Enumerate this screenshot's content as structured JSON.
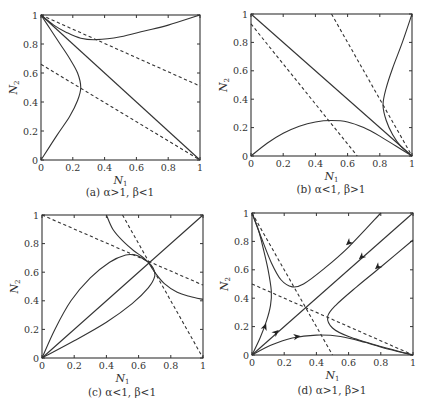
{
  "chart_data": [
    {
      "id": "a",
      "type": "line",
      "title": "",
      "caption": "(a) α>1, β<1",
      "xlabel": "N",
      "xlabel_sub": "1",
      "ylabel": "N",
      "ylabel_sub": "2",
      "xlim": [
        0,
        1
      ],
      "ylim": [
        0,
        1
      ],
      "xticks": [
        "0",
        "0.2",
        "0.4",
        "0.6",
        "0.8",
        "1"
      ],
      "yticks": [
        "0",
        "0.2",
        "0.4",
        "0.6",
        "0.8",
        "1"
      ],
      "grid": false,
      "frame": {
        "left": 41,
        "top": 15,
        "right": 200,
        "bottom": 160
      },
      "series": [
        {
          "name": "solid-diagonal",
          "style": "solid",
          "points": [
            [
              0,
              1
            ],
            [
              1,
              0
            ]
          ]
        },
        {
          "name": "nullcline-1",
          "style": "dashed",
          "points": [
            [
              0,
              1
            ],
            [
              1,
              0.51
            ]
          ]
        },
        {
          "name": "nullcline-2",
          "style": "dashed",
          "points": [
            [
              0,
              0.66
            ],
            [
              1,
              0
            ]
          ]
        },
        {
          "name": "trajectory-left",
          "style": "solid",
          "points": [
            [
              0,
              0
            ],
            [
              0.1,
              0.17
            ],
            [
              0.18,
              0.3
            ],
            [
              0.23,
              0.41
            ],
            [
              0.25,
              0.5
            ],
            [
              0.23,
              0.6
            ],
            [
              0.18,
              0.7
            ],
            [
              0.12,
              0.8
            ],
            [
              0.06,
              0.9
            ],
            [
              0,
              1
            ]
          ]
        },
        {
          "name": "trajectory-top",
          "style": "solid",
          "points": [
            [
              0,
              1
            ],
            [
              0.08,
              0.93
            ],
            [
              0.16,
              0.88
            ],
            [
              0.25,
              0.84
            ],
            [
              0.35,
              0.83
            ],
            [
              0.5,
              0.85
            ],
            [
              0.65,
              0.89
            ],
            [
              0.8,
              0.93
            ],
            [
              1,
              1
            ]
          ]
        }
      ]
    },
    {
      "id": "b",
      "type": "line",
      "title": "",
      "caption": "(b) α<1, β>1",
      "xlabel": "N",
      "xlabel_sub": "1",
      "ylabel": "N",
      "ylabel_sub": "2",
      "xlim": [
        0,
        1
      ],
      "ylim": [
        0,
        1
      ],
      "xticks": [
        "0",
        "0.2",
        "0.4",
        "0.6",
        "0.8",
        "1"
      ],
      "yticks": [
        "0",
        "0.2",
        "0.4",
        "0.6",
        "0.8",
        "1"
      ],
      "grid": false,
      "frame": {
        "left": 251,
        "top": 14,
        "right": 412,
        "bottom": 156
      },
      "series": [
        {
          "name": "solid-diagonal",
          "style": "solid",
          "points": [
            [
              0,
              1
            ],
            [
              1,
              0
            ]
          ]
        },
        {
          "name": "nullcline-1",
          "style": "dashed",
          "points": [
            [
              0,
              0.93
            ],
            [
              0.66,
              0
            ]
          ]
        },
        {
          "name": "nullcline-2",
          "style": "dashed",
          "points": [
            [
              0.5,
              1
            ],
            [
              1,
              0
            ]
          ]
        },
        {
          "name": "trajectory-bottom",
          "style": "solid",
          "points": [
            [
              0,
              0
            ],
            [
              0.1,
              0.09
            ],
            [
              0.2,
              0.16
            ],
            [
              0.3,
              0.21
            ],
            [
              0.4,
              0.24
            ],
            [
              0.5,
              0.25
            ],
            [
              0.6,
              0.24
            ],
            [
              0.7,
              0.2
            ],
            [
              0.8,
              0.14
            ],
            [
              0.9,
              0.07
            ],
            [
              1,
              0
            ]
          ]
        },
        {
          "name": "trajectory-right",
          "style": "solid",
          "points": [
            [
              1,
              1
            ],
            [
              0.94,
              0.8
            ],
            [
              0.88,
              0.62
            ],
            [
              0.84,
              0.48
            ],
            [
              0.82,
              0.36
            ],
            [
              0.84,
              0.25
            ],
            [
              0.88,
              0.15
            ],
            [
              0.93,
              0.07
            ],
            [
              1,
              0
            ]
          ]
        }
      ]
    },
    {
      "id": "c",
      "type": "line",
      "title": "",
      "caption": "(c) α<1, β<1",
      "xlabel": "N",
      "xlabel_sub": "1",
      "ylabel": "N",
      "ylabel_sub": "2",
      "xlim": [
        0,
        1
      ],
      "ylim": [
        0,
        1
      ],
      "xticks": [
        "0",
        "0.2",
        "0.4",
        "0.6",
        "0.8",
        "1"
      ],
      "yticks": [
        "0",
        "0.2",
        "0.4",
        "0.6",
        "0.8",
        "1"
      ],
      "grid": false,
      "frame": {
        "left": 42,
        "top": 215,
        "right": 203,
        "bottom": 358
      },
      "equilibrium": [
        0.66,
        0.67
      ],
      "series": [
        {
          "name": "solid-diagonal",
          "style": "solid",
          "points": [
            [
              0,
              0
            ],
            [
              1,
              1
            ]
          ]
        },
        {
          "name": "nullcline-1",
          "style": "dashed",
          "points": [
            [
              0,
              1
            ],
            [
              1,
              0.51
            ]
          ]
        },
        {
          "name": "nullcline-2",
          "style": "dashed",
          "points": [
            [
              0.5,
              1
            ],
            [
              1,
              0
            ]
          ]
        },
        {
          "name": "trajectory-upper-lobe",
          "style": "solid",
          "points": [
            [
              0,
              0
            ],
            [
              0.08,
              0.2
            ],
            [
              0.18,
              0.4
            ],
            [
              0.3,
              0.56
            ],
            [
              0.42,
              0.67
            ],
            [
              0.52,
              0.72
            ],
            [
              0.58,
              0.72
            ],
            [
              0.62,
              0.7
            ],
            [
              0.66,
              0.67
            ]
          ]
        },
        {
          "name": "trajectory-lower-lobe",
          "style": "solid",
          "points": [
            [
              0,
              0
            ],
            [
              0.2,
              0.12
            ],
            [
              0.4,
              0.25
            ],
            [
              0.56,
              0.38
            ],
            [
              0.66,
              0.49
            ],
            [
              0.7,
              0.57
            ],
            [
              0.69,
              0.63
            ],
            [
              0.66,
              0.67
            ]
          ]
        },
        {
          "name": "trajectory-top",
          "style": "solid",
          "points": [
            [
              0.4,
              1
            ],
            [
              0.44,
              0.9
            ],
            [
              0.5,
              0.82
            ],
            [
              0.57,
              0.75
            ],
            [
              0.62,
              0.71
            ],
            [
              0.66,
              0.67
            ]
          ]
        },
        {
          "name": "trajectory-right",
          "style": "solid",
          "points": [
            [
              0.66,
              0.67
            ],
            [
              0.7,
              0.6
            ],
            [
              0.76,
              0.52
            ],
            [
              0.84,
              0.46
            ],
            [
              0.92,
              0.43
            ],
            [
              1,
              0.41
            ]
          ]
        }
      ]
    },
    {
      "id": "d",
      "type": "line",
      "title": "",
      "caption": "(d) α>1, β>1",
      "xlabel": "N",
      "xlabel_sub": "1",
      "ylabel": "N",
      "ylabel_sub": "2",
      "xlim": [
        0,
        1
      ],
      "ylim": [
        0,
        1
      ],
      "xticks": [
        "0",
        "0.2",
        "0.4",
        "0.6",
        "0.8",
        "1"
      ],
      "yticks": [
        "0",
        "0.2",
        "0.4",
        "0.6",
        "0.8",
        "1"
      ],
      "grid": false,
      "frame": {
        "left": 252,
        "top": 213,
        "right": 413,
        "bottom": 355
      },
      "series": [
        {
          "name": "solid-diagonal",
          "style": "solid",
          "points": [
            [
              0,
              0
            ],
            [
              1,
              1
            ]
          ]
        },
        {
          "name": "nullcline-1",
          "style": "dashed",
          "points": [
            [
              0,
              1
            ],
            [
              0.5,
              0
            ]
          ]
        },
        {
          "name": "nullcline-2",
          "style": "dashed",
          "points": [
            [
              0,
              0.5
            ],
            [
              1,
              0
            ]
          ]
        },
        {
          "name": "trajectory-left",
          "style": "solid",
          "points": [
            [
              0,
              0
            ],
            [
              0.05,
              0.12
            ],
            [
              0.09,
              0.24
            ],
            [
              0.115,
              0.35
            ],
            [
              0.12,
              0.45
            ],
            [
              0.1,
              0.6
            ],
            [
              0.07,
              0.75
            ],
            [
              0.04,
              0.88
            ],
            [
              0,
              1
            ]
          ]
        },
        {
          "name": "trajectory-bottom",
          "style": "solid",
          "points": [
            [
              0,
              0
            ],
            [
              0.12,
              0.07
            ],
            [
              0.25,
              0.12
            ],
            [
              0.4,
              0.14
            ],
            [
              0.55,
              0.13
            ],
            [
              0.7,
              0.09
            ],
            [
              0.85,
              0.04
            ],
            [
              1,
              0
            ]
          ]
        },
        {
          "name": "trajectory-upper-branch",
          "style": "solid",
          "points": [
            [
              0,
              1
            ],
            [
              0.06,
              0.82
            ],
            [
              0.12,
              0.65
            ],
            [
              0.18,
              0.53
            ],
            [
              0.25,
              0.48
            ],
            [
              0.32,
              0.5
            ],
            [
              0.45,
              0.61
            ],
            [
              0.6,
              0.76
            ],
            [
              0.8,
              1
            ]
          ]
        },
        {
          "name": "trajectory-lower-branch",
          "style": "solid",
          "points": [
            [
              1,
              0
            ],
            [
              0.8,
              0.06
            ],
            [
              0.6,
              0.13
            ],
            [
              0.5,
              0.19
            ],
            [
              0.47,
              0.27
            ],
            [
              0.52,
              0.35
            ],
            [
              0.65,
              0.48
            ],
            [
              0.8,
              0.62
            ],
            [
              1,
              0.81
            ]
          ]
        }
      ],
      "arrows": [
        {
          "at": [
            0.08,
            0.2
          ],
          "toward": [
            0.1,
            0.26
          ]
        },
        {
          "at": [
            0.15,
            0.16
          ],
          "toward": [
            0.2,
            0.21
          ]
        },
        {
          "at": [
            0.28,
            0.13
          ],
          "toward": [
            0.34,
            0.14
          ]
        },
        {
          "at": [
            0.6,
            0.79
          ],
          "toward": [
            0.56,
            0.75
          ]
        },
        {
          "at": [
            0.68,
            0.69
          ],
          "toward": [
            0.63,
            0.64
          ]
        },
        {
          "at": [
            0.78,
            0.62
          ],
          "toward": [
            0.74,
            0.58
          ]
        }
      ]
    }
  ]
}
